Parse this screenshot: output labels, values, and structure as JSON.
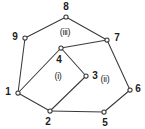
{
  "figure": {
    "type": "planar-graph-diagram",
    "width": 145,
    "height": 129,
    "background_color": "#ffffff",
    "stroke_color": "#3a3a3a",
    "text_color": "#1d1d1d"
  },
  "vertices": [
    {
      "id": "1",
      "label": "1",
      "cx": 18,
      "cy": 93,
      "label_x": 8,
      "label_y": 92
    },
    {
      "id": "2",
      "label": "2",
      "cx": 50,
      "cy": 111,
      "label_x": 48,
      "label_y": 122
    },
    {
      "id": "3",
      "label": "3",
      "cx": 86,
      "cy": 76,
      "label_x": 95,
      "label_y": 76
    },
    {
      "id": "4",
      "label": "4",
      "cx": 61,
      "cy": 48,
      "label_x": 59,
      "label_y": 60
    },
    {
      "id": "5",
      "label": "5",
      "cx": 104,
      "cy": 112,
      "label_x": 105,
      "label_y": 123
    },
    {
      "id": "6",
      "label": "6",
      "cx": 130,
      "cy": 90,
      "label_x": 138,
      "label_y": 89
    },
    {
      "id": "7",
      "label": "7",
      "cx": 107,
      "cy": 40,
      "label_x": 117,
      "label_y": 38
    },
    {
      "id": "8",
      "label": "8",
      "cx": 66,
      "cy": 17,
      "label_x": 66,
      "label_y": 7
    },
    {
      "id": "9",
      "label": "9",
      "cx": 25,
      "cy": 38,
      "label_x": 15,
      "label_y": 37
    }
  ],
  "edges": [
    {
      "from": "1",
      "to": "2",
      "x1": 18,
      "y1": 93,
      "x2": 50,
      "y2": 111
    },
    {
      "from": "2",
      "to": "3",
      "x1": 50,
      "y1": 111,
      "x2": 86,
      "y2": 76
    },
    {
      "from": "3",
      "to": "4",
      "x1": 86,
      "y1": 76,
      "x2": 61,
      "y2": 48
    },
    {
      "from": "4",
      "to": "1",
      "x1": 61,
      "y1": 48,
      "x2": 18,
      "y2": 93
    },
    {
      "from": "2",
      "to": "5",
      "x1": 50,
      "y1": 111,
      "x2": 104,
      "y2": 112
    },
    {
      "from": "5",
      "to": "6",
      "x1": 104,
      "y1": 112,
      "x2": 130,
      "y2": 90
    },
    {
      "from": "6",
      "to": "7",
      "x1": 130,
      "y1": 90,
      "x2": 107,
      "y2": 40
    },
    {
      "from": "7",
      "to": "4",
      "x1": 107,
      "y1": 40,
      "x2": 61,
      "y2": 48
    },
    {
      "from": "7",
      "to": "8",
      "x1": 107,
      "y1": 40,
      "x2": 66,
      "y2": 17
    },
    {
      "from": "8",
      "to": "9",
      "x1": 66,
      "y1": 17,
      "x2": 25,
      "y2": 38
    },
    {
      "from": "9",
      "to": "1",
      "x1": 25,
      "y1": 38,
      "x2": 18,
      "y2": 93
    }
  ],
  "regions": [
    {
      "id": "i",
      "label": "(i)",
      "x": 58,
      "y": 76
    },
    {
      "id": "ii",
      "label": "(ii)",
      "x": 105,
      "y": 79
    },
    {
      "id": "iii",
      "label": "(iii)",
      "x": 65,
      "y": 32
    }
  ]
}
